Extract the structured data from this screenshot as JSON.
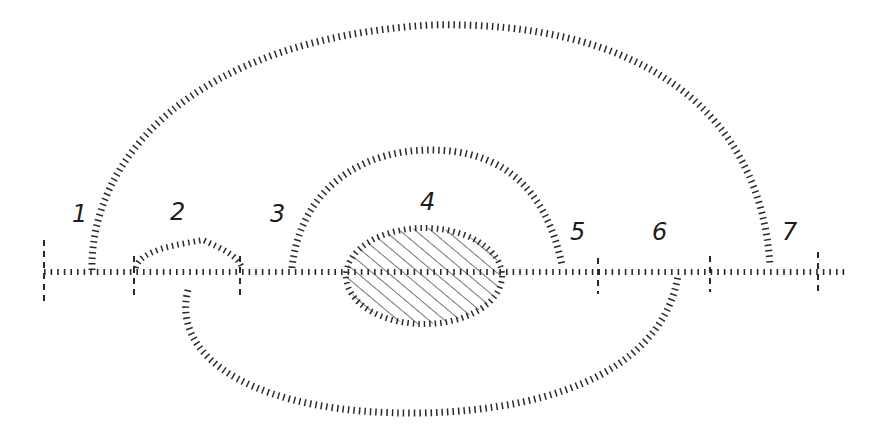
{
  "diagram": {
    "labels": [
      {
        "id": "1",
        "text": "1",
        "x": 72,
        "y": 222
      },
      {
        "id": "2",
        "text": "2",
        "x": 170,
        "y": 220
      },
      {
        "id": "3",
        "text": "3",
        "x": 270,
        "y": 222
      },
      {
        "id": "4",
        "text": "4",
        "x": 420,
        "y": 210
      },
      {
        "id": "5",
        "text": "5",
        "x": 570,
        "y": 240
      },
      {
        "id": "6",
        "text": "6",
        "x": 652,
        "y": 240
      },
      {
        "id": "7",
        "text": "7",
        "x": 782,
        "y": 240
      }
    ],
    "baseline": {
      "y": 272,
      "x_start": 44,
      "x_end": 845
    },
    "ticks": [
      44,
      134,
      240,
      598,
      710,
      818
    ],
    "arcs": [
      {
        "name": "outer-upper-arc",
        "from_label": "1",
        "to_label": "7"
      },
      {
        "name": "inner-upper-arc",
        "from_label": "3",
        "to_label": "5"
      },
      {
        "name": "lower-arc",
        "from_label": "2",
        "to_label": "6"
      }
    ],
    "shapes": [
      {
        "name": "hatched-ellipse",
        "at_label": "4"
      },
      {
        "name": "bump",
        "at_label": "2"
      }
    ],
    "colors": {
      "ink": "#2a2a2a",
      "background": "#ffffff"
    }
  }
}
